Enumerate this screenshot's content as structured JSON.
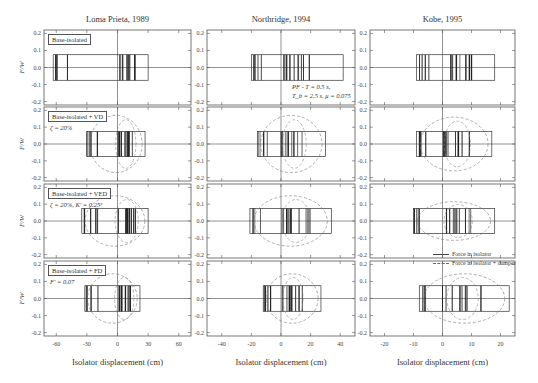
{
  "figure": {
    "column_titles": [
      "Loma Prieta, 1989",
      "Northridge, 1994",
      "Kobe, 1995"
    ],
    "row_labels": [
      {
        "box": "Base-isolated",
        "param": ""
      },
      {
        "box": "Base-isolated + VD",
        "param": "ζ = 20%"
      },
      {
        "box": "Base-isolated + VED",
        "param": "ζ = 20%, K' = 0.25ᵖ"
      },
      {
        "box": "Base-isolated + FD",
        "param": "F' = 0.07"
      }
    ],
    "ylabel": "F/W",
    "xlabel": "Isolator displacement (cm)",
    "annotation": [
      "PF - T = 0.5 s,",
      "T_b = 2.5 s, μ = 0.075"
    ],
    "legend": [
      {
        "label": "Force in isolator",
        "style": "solid"
      },
      {
        "label": "Force in isolator + damper",
        "style": "dashed"
      }
    ],
    "y_ticks": [
      "0.2",
      "0.1",
      "0.0",
      "-0.1",
      "-0.2"
    ],
    "x_ticks": [
      [
        "-60",
        "-30",
        "0",
        "30",
        "60"
      ],
      [
        "-40",
        "-20",
        "0",
        "20",
        "40"
      ],
      [
        "-20",
        "-10",
        "0",
        "10",
        "20"
      ]
    ]
  },
  "chart_data": {
    "type": "line",
    "xlabel": "Isolator displacement (cm)",
    "ylabel": "F/W",
    "ylim": [
      -0.22,
      0.22
    ],
    "grid": false,
    "legend_position": "inside lower-right (Kobe, VED panel)",
    "columns": [
      {
        "earthquake": "Loma Prieta, 1989",
        "xlim": [
          -72,
          72
        ],
        "x_ticks": [
          -60,
          -30,
          0,
          30,
          60
        ]
      },
      {
        "earthquake": "Northridge, 1994",
        "xlim": [
          -50,
          50
        ],
        "x_ticks": [
          -40,
          -20,
          0,
          20,
          40
        ]
      },
      {
        "earthquake": "Kobe, 1995",
        "xlim": [
          -25,
          25
        ],
        "x_ticks": [
          -20,
          -10,
          0,
          10,
          20
        ]
      }
    ],
    "panels": [
      {
        "row": "Base-isolated",
        "col": "Loma Prieta, 1989",
        "isolator_disp_range": [
          -63,
          30
        ],
        "isolator_force": 0.075,
        "damper_force_peak": null
      },
      {
        "row": "Base-isolated",
        "col": "Northridge, 1994",
        "isolator_disp_range": [
          -20,
          42
        ],
        "isolator_force": 0.075,
        "damper_force_peak": null
      },
      {
        "row": "Base-isolated",
        "col": "Kobe, 1995",
        "isolator_disp_range": [
          -9,
          18
        ],
        "isolator_force": 0.075,
        "damper_force_peak": null
      },
      {
        "row": "Base-isolated + VD",
        "col": "Loma Prieta, 1989",
        "isolator_disp_range": [
          -30,
          27
        ],
        "isolator_force": 0.075,
        "damper_force_peak": 0.17
      },
      {
        "row": "Base-isolated + VD",
        "col": "Northridge, 1994",
        "isolator_disp_range": [
          -16,
          30
        ],
        "isolator_force": 0.075,
        "damper_force_peak": 0.17
      },
      {
        "row": "Base-isolated + VD",
        "col": "Kobe, 1995",
        "isolator_disp_range": [
          -9,
          17
        ],
        "isolator_force": 0.075,
        "damper_force_peak": 0.16
      },
      {
        "row": "Base-isolated + VED",
        "col": "Loma Prieta, 1989",
        "isolator_disp_range": [
          -35,
          30
        ],
        "isolator_force": 0.075,
        "damper_force_peak": 0.15
      },
      {
        "row": "Base-isolated + VED",
        "col": "Northridge, 1994",
        "isolator_disp_range": [
          -21,
          34
        ],
        "isolator_force": 0.075,
        "damper_force_peak": 0.15
      },
      {
        "row": "Base-isolated + VED",
        "col": "Kobe, 1995",
        "isolator_disp_range": [
          -10,
          18
        ],
        "isolator_force": 0.075,
        "damper_force_peak": 0.115
      },
      {
        "row": "Base-isolated + FD",
        "col": "Loma Prieta, 1989",
        "isolator_disp_range": [
          -32,
          22
        ],
        "isolator_force": 0.075,
        "damper_force_peak": 0.145
      },
      {
        "row": "Base-isolated + FD",
        "col": "Northridge, 1994",
        "isolator_disp_range": [
          -12,
          27
        ],
        "isolator_force": 0.075,
        "damper_force_peak": 0.145
      },
      {
        "row": "Base-isolated + FD",
        "col": "Kobe, 1995",
        "isolator_disp_range": [
          -8,
          23
        ],
        "isolator_force": 0.075,
        "damper_force_peak": 0.145
      }
    ]
  }
}
